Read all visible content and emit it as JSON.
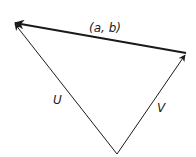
{
  "diagram": {
    "type": "vector-triangle",
    "colors": {
      "line": "#1a1a1a",
      "background": "#ffffff"
    },
    "vertices": {
      "bottom": [
        117,
        154
      ],
      "top_left": [
        14,
        23
      ],
      "top_right": [
        186,
        53
      ]
    },
    "vectors": [
      {
        "name": "U",
        "label": "U",
        "from": "bottom",
        "to": "top_left"
      },
      {
        "name": "V",
        "label": "V",
        "from": "bottom",
        "to": "top_right"
      },
      {
        "name": "ab",
        "label": "(a, b)",
        "from": "top_right",
        "to": "top_left",
        "bold": true
      }
    ]
  }
}
